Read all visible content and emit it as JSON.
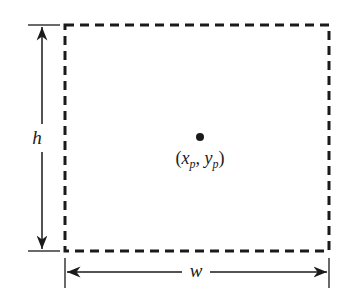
{
  "diagram": {
    "height_label": "h",
    "width_label": "w",
    "point_label": {
      "open": "(",
      "x": "x",
      "x_sub": "p",
      "comma": ", ",
      "y": "y",
      "y_sub": "p",
      "close": ")"
    },
    "colors": {
      "stroke": "#1a1a1a",
      "background": "#ffffff"
    }
  }
}
